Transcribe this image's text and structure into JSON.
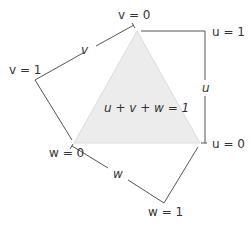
{
  "diagram": {
    "triangle_label": "u + v + w = 1",
    "fill_color": "#ececec",
    "stroke_color": "#555555",
    "labels": {
      "v0": "v = 0",
      "v1": "v = 1",
      "v": "v",
      "u1": "u = 1",
      "u0": "u = 0",
      "u": "u",
      "w0": "w = 0",
      "w1": "w = 1",
      "w": "w"
    }
  }
}
